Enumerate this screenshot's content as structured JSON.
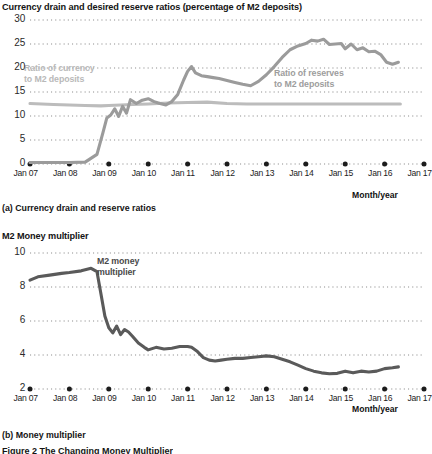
{
  "figure": {
    "caption": "Figure 2 The Changing Money Multiplier",
    "axis_label": "Month/year"
  },
  "panel_a": {
    "title": "Currency drain and desired reserve ratios (percentage of M2 deposits)",
    "subcaption": "(a) Currency drain and reserve ratios",
    "label_currency": "Ratio of currency\nto M2 deposits",
    "label_currency_line1": "Ratio of currency",
    "label_currency_line2": "to M2 deposits",
    "label_reserves_line1": "Ratio of reserves",
    "label_reserves_line2": "to M2 deposits",
    "color_currency": "#bcbcbc",
    "color_reserves": "#9b9b9b"
  },
  "panel_b": {
    "title": "M2 Money multiplier",
    "subcaption": "(b) Money multiplier",
    "label_mm_line1": "M2 money",
    "label_mm_line2": "multiplier",
    "color_mm": "#5a5a5a"
  },
  "chart_data": [
    {
      "type": "line",
      "id": "panel-a",
      "title": "Currency drain and desired reserve ratios (percentage of M2 deposits)",
      "xlabel": "Month/year",
      "ylabel": "",
      "ylim": [
        0,
        30
      ],
      "yticks": [
        0,
        5,
        10,
        15,
        20,
        25,
        30
      ],
      "xticks": [
        "Jan 07",
        "Jan 08",
        "Jan 09",
        "Jan 10",
        "Jan 11",
        "Jan 12",
        "Jan 13",
        "Jan 14",
        "Jan 15",
        "Jan 16",
        "Jan 17"
      ],
      "xlim": [
        2007.0,
        2017.0
      ],
      "grid": "dotted-horizontal",
      "legend": "inline-annotation",
      "series": [
        {
          "name": "Ratio of currency to M2 deposits",
          "color": "#bcbcbc",
          "x": [
            2007.0,
            2007.3,
            2007.6,
            2008.0,
            2008.4,
            2008.8,
            2009.0,
            2009.3,
            2009.6,
            2010.0,
            2010.5,
            2011.0,
            2011.5,
            2012.0,
            2012.5,
            2013.0,
            2013.5,
            2014.0,
            2014.5,
            2015.0,
            2015.5,
            2016.0,
            2016.4
          ],
          "values": [
            12.6,
            12.5,
            12.4,
            12.3,
            12.2,
            12.1,
            12.2,
            12.3,
            12.4,
            12.5,
            12.7,
            12.8,
            12.9,
            12.6,
            12.5,
            12.5,
            12.5,
            12.5,
            12.5,
            12.5,
            12.5,
            12.5,
            12.5
          ]
        },
        {
          "name": "Ratio of reserves to M2 deposits",
          "color": "#9b9b9b",
          "x": [
            2007.0,
            2007.5,
            2008.0,
            2008.4,
            2008.7,
            2008.85,
            2008.95,
            2009.05,
            2009.15,
            2009.25,
            2009.35,
            2009.45,
            2009.55,
            2009.7,
            2009.85,
            2010.0,
            2010.15,
            2010.3,
            2010.45,
            2010.6,
            2010.75,
            2010.9,
            2011.0,
            2011.1,
            2011.2,
            2011.35,
            2011.5,
            2011.65,
            2011.8,
            2012.0,
            2012.2,
            2012.4,
            2012.6,
            2012.8,
            2013.0,
            2013.2,
            2013.4,
            2013.6,
            2013.8,
            2014.0,
            2014.15,
            2014.3,
            2014.45,
            2014.6,
            2014.75,
            2014.9,
            2015.0,
            2015.15,
            2015.3,
            2015.45,
            2015.6,
            2015.75,
            2015.9,
            2016.05,
            2016.2,
            2016.35
          ],
          "values": [
            0.3,
            0.3,
            0.3,
            0.4,
            2.0,
            6.5,
            9.6,
            10.2,
            11.5,
            9.9,
            12.0,
            10.6,
            13.4,
            12.6,
            13.3,
            13.6,
            13.0,
            12.6,
            12.3,
            13.0,
            14.5,
            17.5,
            19.3,
            20.3,
            19.0,
            18.4,
            18.2,
            18.0,
            17.8,
            17.4,
            17.0,
            16.6,
            16.3,
            17.2,
            18.6,
            20.3,
            22.2,
            23.8,
            24.6,
            25.1,
            25.8,
            25.6,
            26.0,
            24.9,
            25.0,
            25.1,
            24.0,
            25.0,
            23.8,
            24.2,
            23.4,
            23.5,
            22.8,
            21.2,
            20.8,
            21.2
          ]
        }
      ]
    },
    {
      "type": "line",
      "id": "panel-b",
      "title": "M2 Money multiplier",
      "xlabel": "Month/year",
      "ylabel": "",
      "ylim": [
        2,
        10
      ],
      "yticks": [
        2,
        4,
        6,
        8,
        10
      ],
      "xticks": [
        "Jan 07",
        "Jan 08",
        "Jan 09",
        "Jan 10",
        "Jan 11",
        "Jan 12",
        "Jan 13",
        "Jan 14",
        "Jan 15",
        "Jan 16",
        "Jan 17"
      ],
      "xlim": [
        2007.0,
        2017.0
      ],
      "grid": "dotted-horizontal",
      "legend": "inline-annotation",
      "series": [
        {
          "name": "M2 money multiplier",
          "color": "#5a5a5a",
          "x": [
            2007.0,
            2007.2,
            2007.5,
            2007.8,
            2008.0,
            2008.3,
            2008.55,
            2008.7,
            2008.8,
            2008.9,
            2009.0,
            2009.1,
            2009.2,
            2009.3,
            2009.4,
            2009.5,
            2009.6,
            2009.75,
            2009.9,
            2010.0,
            2010.2,
            2010.4,
            2010.6,
            2010.8,
            2011.0,
            2011.1,
            2011.25,
            2011.4,
            2011.55,
            2011.7,
            2011.85,
            2012.0,
            2012.2,
            2012.4,
            2012.6,
            2012.8,
            2013.0,
            2013.2,
            2013.4,
            2013.6,
            2013.8,
            2014.0,
            2014.2,
            2014.4,
            2014.6,
            2014.8,
            2015.0,
            2015.2,
            2015.4,
            2015.6,
            2015.8,
            2016.0,
            2016.2,
            2016.35
          ],
          "values": [
            8.4,
            8.6,
            8.7,
            8.8,
            8.85,
            8.95,
            9.1,
            8.9,
            7.6,
            6.3,
            5.6,
            5.3,
            5.7,
            5.2,
            5.5,
            5.35,
            5.1,
            4.7,
            4.45,
            4.3,
            4.45,
            4.35,
            4.4,
            4.5,
            4.5,
            4.45,
            4.2,
            3.85,
            3.7,
            3.65,
            3.7,
            3.75,
            3.8,
            3.8,
            3.85,
            3.9,
            3.95,
            3.9,
            3.75,
            3.6,
            3.4,
            3.2,
            3.05,
            2.95,
            2.9,
            2.92,
            3.05,
            2.95,
            3.05,
            3.0,
            3.05,
            3.2,
            3.25,
            3.3
          ]
        }
      ]
    }
  ]
}
